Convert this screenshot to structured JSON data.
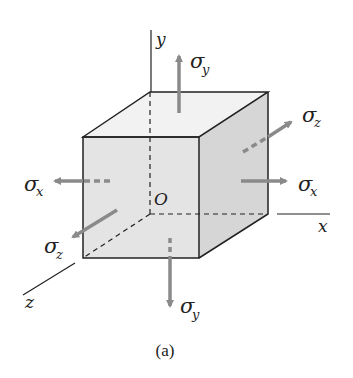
{
  "figure": {
    "caption": "(a)",
    "colors": {
      "edge": "#222222",
      "front_face": "#e4e4e4",
      "top_face": "#f2f2f2",
      "side_face": "#d6d6d6",
      "arrow": "#8a8a8a"
    }
  },
  "axes": {
    "x": "x",
    "y": "y",
    "z": "z",
    "origin": "O"
  },
  "stresses": {
    "sigma": "σ",
    "top": "y",
    "bottom": "y",
    "right": "x",
    "left": "x",
    "back": "z",
    "front": "z"
  }
}
